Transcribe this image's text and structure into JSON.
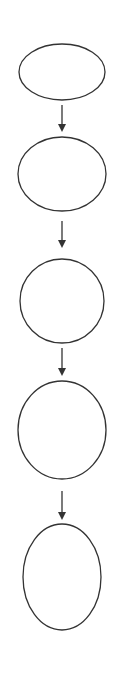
{
  "diagram": {
    "type": "vertical-flow",
    "stroke_color": "#333333",
    "background": "#ffffff",
    "nodes": [
      {
        "id": "node-1",
        "shape": "ellipse",
        "cx": 62,
        "cy": 72,
        "rx": 43,
        "ry": 28,
        "label": ""
      },
      {
        "id": "node-2",
        "shape": "ellipse",
        "cx": 62,
        "cy": 174,
        "rx": 44,
        "ry": 37,
        "label": ""
      },
      {
        "id": "node-3",
        "shape": "ellipse",
        "cx": 62,
        "cy": 301,
        "rx": 42,
        "ry": 42,
        "label": ""
      },
      {
        "id": "node-4",
        "shape": "ellipse",
        "cx": 62,
        "cy": 430,
        "rx": 44,
        "ry": 49,
        "label": ""
      },
      {
        "id": "node-5",
        "shape": "ellipse",
        "cx": 62,
        "cy": 577,
        "rx": 39,
        "ry": 53,
        "label": ""
      }
    ],
    "edges": [
      {
        "from": "node-1",
        "to": "node-2",
        "x": 62,
        "y1": 105,
        "y2": 132
      },
      {
        "from": "node-2",
        "to": "node-3",
        "x": 62,
        "y1": 221,
        "y2": 248
      },
      {
        "from": "node-3",
        "to": "node-4",
        "x": 62,
        "y1": 348,
        "y2": 376
      },
      {
        "from": "node-4",
        "to": "node-5",
        "x": 62,
        "y1": 491,
        "y2": 520
      }
    ]
  }
}
